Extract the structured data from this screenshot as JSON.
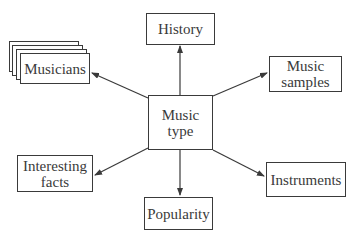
{
  "diagram": {
    "type": "mind-map",
    "colors": {
      "stroke": "#3a3a3a",
      "background": "#ffffff",
      "text": "#3a3a3a"
    },
    "center": {
      "id": "music-type",
      "label": "Music\ntype"
    },
    "nodes": [
      {
        "id": "history",
        "label": "History"
      },
      {
        "id": "musicians",
        "label": "Musicians",
        "stacked": true
      },
      {
        "id": "music-samples",
        "label": "Music\nsamples"
      },
      {
        "id": "interesting-facts",
        "label": "Interesting\nfacts"
      },
      {
        "id": "popularity",
        "label": "Popularity"
      },
      {
        "id": "instruments",
        "label": "Instruments"
      }
    ],
    "edges": [
      {
        "from": "music-type",
        "to": "history"
      },
      {
        "from": "music-type",
        "to": "musicians"
      },
      {
        "from": "music-type",
        "to": "music-samples"
      },
      {
        "from": "music-type",
        "to": "interesting-facts"
      },
      {
        "from": "music-type",
        "to": "popularity"
      },
      {
        "from": "music-type",
        "to": "instruments"
      }
    ]
  }
}
